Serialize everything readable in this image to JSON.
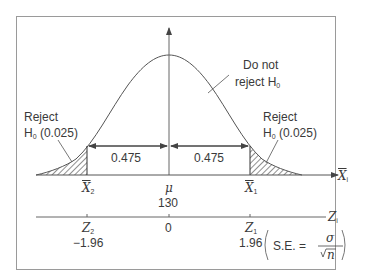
{
  "diagram": {
    "type": "two-tailed hypothesis test normal curve",
    "regions": {
      "accept": {
        "line1": "Do not",
        "line2": "reject H",
        "sub": "0"
      },
      "reject_left": {
        "line1": "Reject",
        "line2": "H",
        "sub": "0",
        "value": " (0.025)"
      },
      "reject_right": {
        "line1": "Reject",
        "line2": "H",
        "sub": "0",
        "value": " (0.025)"
      }
    },
    "areas": {
      "left": "0.475",
      "right": "0.475"
    },
    "x_axis": {
      "label": "X",
      "label_sub": "i",
      "ticks": [
        {
          "name": "X",
          "sub": "2"
        },
        {
          "name": "μ",
          "value": "130"
        },
        {
          "name": "X",
          "sub": "1"
        }
      ]
    },
    "z_axis": {
      "label": "Z",
      "label_sub": "i",
      "ticks": [
        {
          "name": "Z",
          "sub": "2",
          "value": "−1.96"
        },
        {
          "name": "",
          "value": "0"
        },
        {
          "name": "Z",
          "sub": "1",
          "value": "1.96"
        }
      ]
    },
    "formula": {
      "lhs": "S.E. =",
      "numerator": "σ",
      "denominator": "n"
    },
    "colors": {
      "line": "#555555",
      "frame": "#9a9a9a",
      "text": "#3a3a3a"
    }
  }
}
